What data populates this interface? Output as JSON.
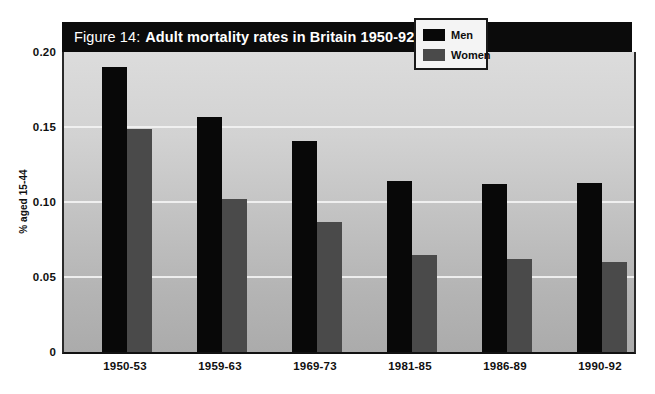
{
  "figure": {
    "title_prefix": "Figure 14:",
    "title_main": "Adult mortality rates in Britain 1950-92 by sex"
  },
  "legend": {
    "position": "top-right",
    "entries": [
      {
        "label": "Men",
        "color": "#080808"
      },
      {
        "label": "Women",
        "color": "#4a4a4a"
      }
    ]
  },
  "axes": {
    "ylabel": "% aged 15-44",
    "yticks": [
      "0.20",
      "0.15",
      "0.10",
      "0.05",
      "0"
    ],
    "xlabel": ""
  },
  "chart_data": {
    "type": "bar",
    "title": "Figure 14: Adult mortality rates in Britain 1950-92 by sex",
    "xlabel": "",
    "ylabel": "% aged 15-44",
    "ylim": [
      0,
      0.2
    ],
    "yticks": [
      0,
      0.05,
      0.1,
      0.15,
      0.2
    ],
    "grid": true,
    "legend_position": "top-right",
    "categories": [
      "1950-53",
      "1959-63",
      "1969-73",
      "1981-85",
      "1986-89",
      "1990-92"
    ],
    "series": [
      {
        "name": "Men",
        "color": "#080808",
        "values": [
          0.19,
          0.157,
          0.141,
          0.114,
          0.112,
          0.113
        ]
      },
      {
        "name": "Women",
        "color": "#4a4a4a",
        "values": [
          0.149,
          0.102,
          0.087,
          0.065,
          0.062,
          0.06
        ]
      }
    ]
  }
}
